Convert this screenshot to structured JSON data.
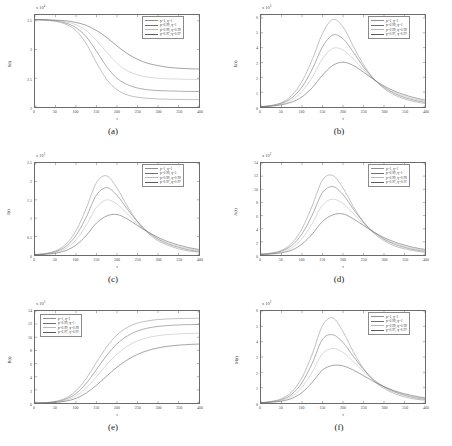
{
  "figure": {
    "background": "#ffffff",
    "panels_layout": "2 columns x 3 rows"
  },
  "series_style": {
    "colors": [
      "#8f8f8f",
      "#6e6e6e",
      "#b9b9b9",
      "#5a5a5a"
    ]
  },
  "legend_entries": [
    "p=1, q=1",
    "p=0.99, q=1",
    "p=0.99, q=0.99",
    "p=0.97, q=0.97"
  ],
  "panels": [
    {
      "caption": "(a)",
      "xlabel": "t",
      "ylabel": "S(t)",
      "exponent": "x 10",
      "exponent_sup": "4",
      "legend_position": "top-right",
      "yticks": [
        "2",
        "2.5",
        "3",
        "3.5"
      ],
      "xticks": [
        "0",
        "50",
        "100",
        "150",
        "200",
        "250",
        "300",
        "350",
        "400"
      ]
    },
    {
      "caption": "(b)",
      "xlabel": "t",
      "ylabel": "E(t)",
      "exponent": "x 10",
      "exponent_sup": "3",
      "legend_position": "top-right",
      "yticks": [
        "0",
        "1",
        "2",
        "3",
        "4",
        "5",
        "6"
      ],
      "xticks": [
        "0",
        "50",
        "100",
        "150",
        "200",
        "250",
        "300",
        "350",
        "400"
      ]
    },
    {
      "caption": "(c)",
      "xlabel": "t",
      "ylabel": "I(t)",
      "exponent": "x 10",
      "exponent_sup": "3",
      "legend_position": "top-right",
      "yticks": [
        "0",
        "0.5",
        "1",
        "1.5",
        "2",
        "2.5"
      ],
      "xticks": [
        "0",
        "50",
        "100",
        "150",
        "200",
        "250",
        "300",
        "350",
        "400"
      ]
    },
    {
      "caption": "(d)",
      "xlabel": "t",
      "ylabel": "A(t)",
      "exponent": "x 10",
      "exponent_sup": "2",
      "legend_position": "top-right",
      "yticks": [
        "0",
        "2",
        "4",
        "6",
        "8",
        "10",
        "12",
        "14"
      ],
      "xticks": [
        "0",
        "50",
        "100",
        "150",
        "200",
        "250",
        "300",
        "350",
        "400"
      ]
    },
    {
      "caption": "(e)",
      "xlabel": "t",
      "ylabel": "R(t)",
      "exponent": "x 10",
      "exponent_sup": "3",
      "legend_position": "top-left",
      "yticks": [
        "0",
        "2",
        "4",
        "6",
        "8",
        "10",
        "12",
        "14"
      ],
      "xticks": [
        "0",
        "50",
        "100",
        "150",
        "200",
        "250",
        "300",
        "350",
        "400"
      ]
    },
    {
      "caption": "(f)",
      "xlabel": "t",
      "ylabel": "M(t)",
      "exponent": "x 10",
      "exponent_sup": "2",
      "legend_position": "top-right",
      "yticks": [
        "0",
        "1",
        "2",
        "3",
        "4",
        "5",
        "6"
      ],
      "xticks": [
        "0",
        "50",
        "100",
        "150",
        "200",
        "250",
        "300",
        "350",
        "400"
      ]
    }
  ],
  "chart_data": [
    {
      "type": "line",
      "title": "(a)",
      "xlabel": "t",
      "ylabel": "S(t)",
      "xlim": [
        0,
        400
      ],
      "ylim": [
        2.0,
        3.6
      ],
      "y_scale": 10000,
      "grid": false,
      "legend_position": "top-right",
      "x": [
        0,
        25,
        50,
        75,
        100,
        125,
        150,
        175,
        200,
        225,
        250,
        275,
        300,
        325,
        350,
        375,
        400
      ],
      "series": [
        {
          "name": "p=1, q=1",
          "values": [
            3.52,
            3.51,
            3.49,
            3.44,
            3.33,
            3.1,
            2.77,
            2.48,
            2.3,
            2.21,
            2.17,
            2.15,
            2.14,
            2.135,
            2.13,
            2.13,
            2.13
          ]
        },
        {
          "name": "p=0.99, q=1",
          "values": [
            3.52,
            3.51,
            3.5,
            3.46,
            3.38,
            3.22,
            2.97,
            2.7,
            2.5,
            2.39,
            2.33,
            2.3,
            2.285,
            2.28,
            2.275,
            2.27,
            2.27
          ]
        },
        {
          "name": "p=0.99, q=0.99",
          "values": [
            3.52,
            3.51,
            3.5,
            3.48,
            3.43,
            3.33,
            3.16,
            2.95,
            2.76,
            2.63,
            2.56,
            2.52,
            2.5,
            2.49,
            2.485,
            2.48,
            2.48
          ]
        },
        {
          "name": "p=0.97, q=0.97",
          "values": [
            3.52,
            3.52,
            3.51,
            3.5,
            3.47,
            3.42,
            3.33,
            3.21,
            3.06,
            2.93,
            2.83,
            2.76,
            2.72,
            2.69,
            2.675,
            2.665,
            2.66
          ]
        }
      ]
    },
    {
      "type": "line",
      "title": "(b)",
      "xlabel": "t",
      "ylabel": "E(t)",
      "xlim": [
        0,
        400
      ],
      "ylim": [
        0,
        6.2
      ],
      "y_scale": 1000,
      "grid": false,
      "legend_position": "top-right",
      "x": [
        0,
        25,
        50,
        75,
        100,
        125,
        150,
        175,
        200,
        225,
        250,
        275,
        300,
        325,
        350,
        375,
        400
      ],
      "series": [
        {
          "name": "p=1, q=1",
          "values": [
            0.02,
            0.1,
            0.3,
            0.78,
            1.72,
            3.2,
            4.95,
            5.9,
            5.4,
            4.1,
            2.85,
            1.9,
            1.25,
            0.82,
            0.54,
            0.36,
            0.24
          ]
        },
        {
          "name": "p=0.99, q=1",
          "values": [
            0.02,
            0.09,
            0.25,
            0.62,
            1.35,
            2.55,
            4.05,
            4.85,
            4.6,
            3.7,
            2.7,
            1.9,
            1.32,
            0.92,
            0.64,
            0.45,
            0.32
          ]
        },
        {
          "name": "p=0.99, q=0.99",
          "values": [
            0.02,
            0.08,
            0.2,
            0.48,
            1.05,
            2.0,
            3.25,
            3.95,
            3.85,
            3.25,
            2.5,
            1.85,
            1.35,
            0.98,
            0.72,
            0.53,
            0.39
          ]
        },
        {
          "name": "p=0.97, q=0.97",
          "values": [
            0.02,
            0.06,
            0.15,
            0.33,
            0.68,
            1.3,
            2.15,
            2.8,
            3.02,
            2.8,
            2.35,
            1.85,
            1.42,
            1.08,
            0.82,
            0.62,
            0.47
          ]
        }
      ]
    },
    {
      "type": "line",
      "title": "(c)",
      "xlabel": "t",
      "ylabel": "I(t)",
      "xlim": [
        0,
        400
      ],
      "ylim": [
        0,
        2.5
      ],
      "y_scale": 1000,
      "grid": false,
      "legend_position": "top-right",
      "x": [
        0,
        25,
        50,
        75,
        100,
        125,
        150,
        175,
        200,
        225,
        250,
        275,
        300,
        325,
        350,
        375,
        400
      ],
      "series": [
        {
          "name": "p=1, q=1",
          "values": [
            0.01,
            0.04,
            0.11,
            0.29,
            0.66,
            1.27,
            1.97,
            2.15,
            1.82,
            1.33,
            0.91,
            0.6,
            0.39,
            0.26,
            0.17,
            0.11,
            0.08
          ]
        },
        {
          "name": "p=0.99, q=1",
          "values": [
            0.01,
            0.03,
            0.09,
            0.23,
            0.53,
            1.03,
            1.63,
            1.83,
            1.62,
            1.25,
            0.9,
            0.63,
            0.43,
            0.3,
            0.21,
            0.14,
            0.1
          ]
        },
        {
          "name": "p=0.99, q=0.99",
          "values": [
            0.01,
            0.03,
            0.07,
            0.18,
            0.41,
            0.81,
            1.3,
            1.5,
            1.38,
            1.12,
            0.84,
            0.62,
            0.45,
            0.32,
            0.23,
            0.17,
            0.12
          ]
        },
        {
          "name": "p=0.97, q=0.97",
          "values": [
            0.01,
            0.02,
            0.05,
            0.12,
            0.27,
            0.53,
            0.87,
            1.06,
            1.1,
            0.98,
            0.8,
            0.63,
            0.48,
            0.36,
            0.27,
            0.2,
            0.15
          ]
        }
      ]
    },
    {
      "type": "line",
      "title": "(d)",
      "xlabel": "t",
      "ylabel": "A(t)",
      "xlim": [
        0,
        400
      ],
      "ylim": [
        0,
        14
      ],
      "y_scale": 100,
      "grid": false,
      "legend_position": "top-right",
      "x": [
        0,
        25,
        50,
        75,
        100,
        125,
        150,
        175,
        200,
        225,
        250,
        275,
        300,
        325,
        350,
        375,
        400
      ],
      "series": [
        {
          "name": "p=1, q=1",
          "values": [
            0.1,
            0.3,
            0.7,
            1.8,
            4.0,
            7.5,
            11.4,
            12.1,
            10.2,
            7.4,
            5.0,
            3.3,
            2.2,
            1.4,
            0.95,
            0.63,
            0.42
          ]
        },
        {
          "name": "p=0.99, q=1",
          "values": [
            0.1,
            0.25,
            0.6,
            1.45,
            3.2,
            6.1,
            9.5,
            10.4,
            9.2,
            7.0,
            5.0,
            3.5,
            2.4,
            1.65,
            1.15,
            0.8,
            0.56
          ]
        },
        {
          "name": "p=0.99, q=0.99",
          "values": [
            0.1,
            0.2,
            0.45,
            1.1,
            2.5,
            4.8,
            7.6,
            8.5,
            7.8,
            6.3,
            4.7,
            3.45,
            2.5,
            1.8,
            1.3,
            0.94,
            0.68
          ]
        },
        {
          "name": "p=0.97, q=0.97",
          "values": [
            0.1,
            0.15,
            0.33,
            0.75,
            1.65,
            3.2,
            5.1,
            6.1,
            6.25,
            5.5,
            4.5,
            3.5,
            2.65,
            2.0,
            1.5,
            1.12,
            0.84
          ]
        }
      ]
    },
    {
      "type": "line",
      "title": "(e)",
      "xlabel": "t",
      "ylabel": "R(t)",
      "xlim": [
        0,
        400
      ],
      "ylim": [
        0,
        14
      ],
      "y_scale": 1000,
      "grid": false,
      "legend_position": "top-left",
      "x": [
        0,
        25,
        50,
        75,
        100,
        125,
        150,
        175,
        200,
        225,
        250,
        275,
        300,
        325,
        350,
        375,
        400
      ],
      "series": [
        {
          "name": "p=1, q=1",
          "values": [
            0.0,
            0.05,
            0.25,
            0.75,
            1.85,
            3.75,
            6.2,
            8.55,
            10.35,
            11.5,
            12.15,
            12.5,
            12.7,
            12.8,
            12.85,
            12.88,
            12.9
          ]
        },
        {
          "name": "p=0.99, q=1",
          "values": [
            0.0,
            0.04,
            0.18,
            0.58,
            1.45,
            3.0,
            5.1,
            7.25,
            9.0,
            10.2,
            10.95,
            11.4,
            11.65,
            11.8,
            11.88,
            11.93,
            11.95
          ]
        },
        {
          "name": "p=0.99, q=0.99",
          "values": [
            0.0,
            0.03,
            0.13,
            0.42,
            1.08,
            2.3,
            4.0,
            5.85,
            7.45,
            8.65,
            9.45,
            9.95,
            10.25,
            10.42,
            10.52,
            10.58,
            10.62
          ]
        },
        {
          "name": "p=0.97, q=0.97",
          "values": [
            0.0,
            0.02,
            0.09,
            0.28,
            0.7,
            1.52,
            2.7,
            4.1,
            5.45,
            6.55,
            7.4,
            7.98,
            8.38,
            8.64,
            8.8,
            8.9,
            8.97
          ]
        }
      ]
    },
    {
      "type": "line",
      "title": "(f)",
      "xlabel": "t",
      "ylabel": "M(t)",
      "xlim": [
        0,
        400
      ],
      "ylim": [
        0,
        6
      ],
      "y_scale": 100,
      "grid": false,
      "legend_position": "top-right",
      "x": [
        0,
        25,
        50,
        75,
        100,
        125,
        150,
        175,
        200,
        225,
        250,
        275,
        300,
        325,
        350,
        375,
        400
      ],
      "series": [
        {
          "name": "p=1, q=1",
          "values": [
            0.02,
            0.1,
            0.28,
            0.72,
            1.65,
            3.2,
            5.05,
            5.55,
            4.65,
            3.35,
            2.25,
            1.45,
            0.95,
            0.62,
            0.4,
            0.26,
            0.18
          ]
        },
        {
          "name": "p=0.99, q=1",
          "values": [
            0.02,
            0.08,
            0.22,
            0.57,
            1.32,
            2.6,
            4.15,
            4.45,
            3.95,
            3.05,
            2.2,
            1.52,
            1.05,
            0.72,
            0.5,
            0.34,
            0.24
          ]
        },
        {
          "name": "p=0.99, q=0.99",
          "values": [
            0.02,
            0.07,
            0.17,
            0.44,
            1.02,
            2.02,
            3.22,
            3.55,
            3.3,
            2.7,
            2.05,
            1.5,
            1.08,
            0.77,
            0.55,
            0.4,
            0.28
          ]
        },
        {
          "name": "p=0.97, q=0.97",
          "values": [
            0.02,
            0.05,
            0.12,
            0.3,
            0.68,
            1.35,
            2.15,
            2.45,
            2.42,
            2.15,
            1.78,
            1.4,
            1.07,
            0.8,
            0.6,
            0.45,
            0.33
          ]
        }
      ]
    }
  ]
}
